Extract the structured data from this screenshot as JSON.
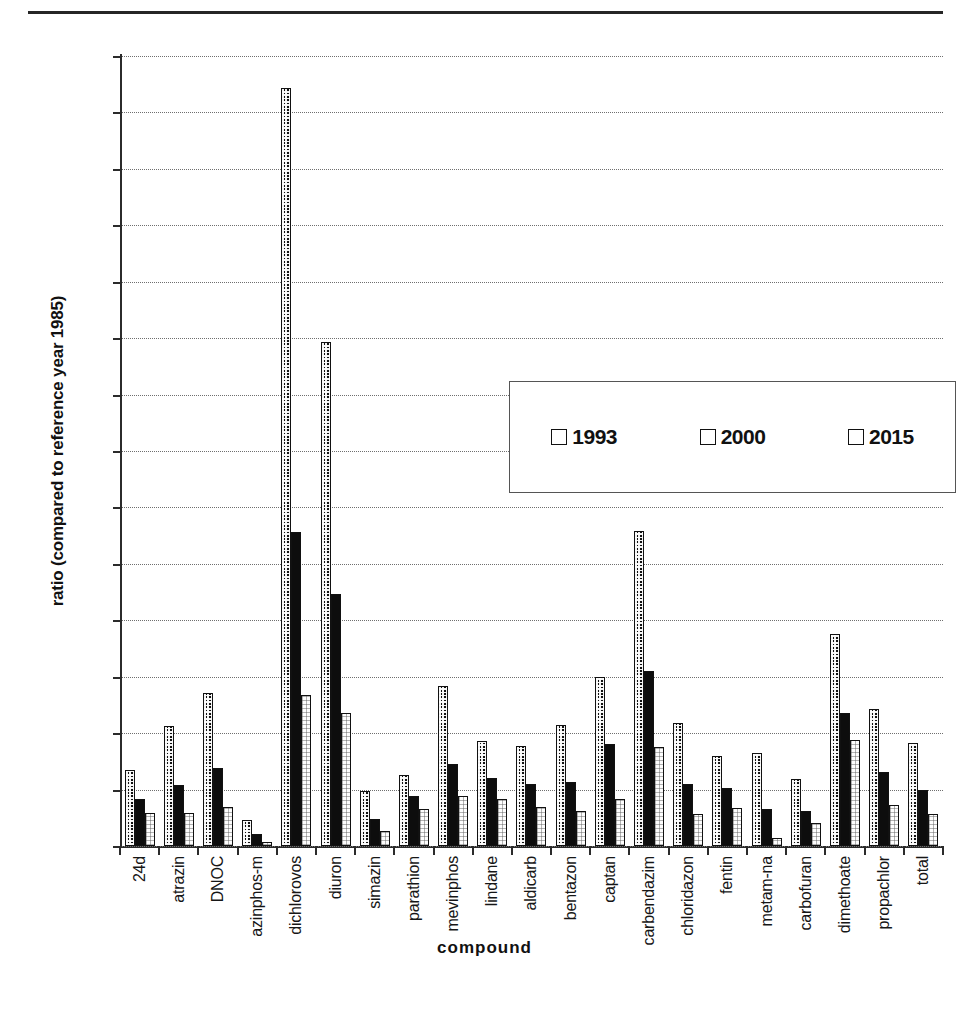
{
  "figure": {
    "axis_title_y": "ratio (compared to reference year 1985)",
    "axis_title_x": "compound"
  },
  "legend": {
    "items": [
      {
        "label": "1993",
        "swatch": "checkered-swatch"
      },
      {
        "label": "2000",
        "swatch": "solid-black-swatch"
      },
      {
        "label": "2015",
        "swatch": "white-swatch"
      }
    ]
  },
  "y_axis": {
    "ticks": [
      "7",
      "6.5",
      "6",
      "5.5",
      "5",
      "4.5",
      "4",
      "3.5",
      "3",
      "2.5",
      "2",
      "1.5",
      "1",
      "0.5",
      "0"
    ]
  },
  "chart_data": {
    "type": "bar",
    "title": "",
    "xlabel": "compound",
    "ylabel": "ratio (compared to reference year 1985)",
    "ylim": [
      0,
      7
    ],
    "ytick_step": 0.5,
    "grid": true,
    "legend_position": "upper-center-inside",
    "categories": [
      "24d",
      "atrazin",
      "DNOC",
      "azinphos-m",
      "dichlorovos",
      "diuron",
      "simazin",
      "parathion",
      "mevinphos",
      "lindane",
      "aldicarb",
      "bentazon",
      "captan",
      "carbendazim",
      "chloridazon",
      "fentin",
      "metam-na",
      "carbofuran",
      "dimethoate",
      "propachlor",
      "total"
    ],
    "series": [
      {
        "name": "1993",
        "values": [
          0.67,
          1.06,
          1.36,
          0.23,
          6.72,
          4.47,
          0.49,
          0.63,
          1.42,
          0.93,
          0.89,
          1.07,
          1.5,
          2.79,
          1.09,
          0.8,
          0.82,
          0.59,
          1.88,
          1.21,
          0.91
        ]
      },
      {
        "name": "2000",
        "values": [
          0.42,
          0.54,
          0.69,
          0.11,
          2.78,
          2.23,
          0.24,
          0.44,
          0.73,
          0.6,
          0.55,
          0.57,
          0.9,
          1.55,
          0.55,
          0.51,
          0.33,
          0.31,
          1.18,
          0.66,
          0.5
        ]
      },
      {
        "name": "2015",
        "values": [
          0.29,
          0.29,
          0.35,
          0.04,
          1.34,
          1.18,
          0.13,
          0.33,
          0.44,
          0.42,
          0.35,
          0.31,
          0.42,
          0.88,
          0.28,
          0.34,
          0.07,
          0.2,
          0.94,
          0.36,
          0.28
        ]
      }
    ]
  }
}
